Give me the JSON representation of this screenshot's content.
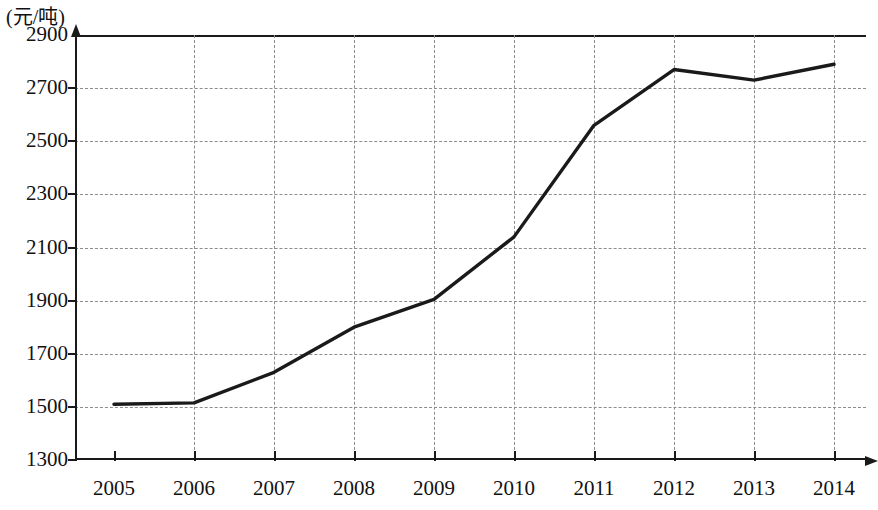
{
  "chart_data": {
    "type": "line",
    "title": "",
    "subtitle": "",
    "ylabel": "(元/吨)",
    "xlabel": "",
    "categories": [
      "2005",
      "2006",
      "2007",
      "2008",
      "2009",
      "2010",
      "2011",
      "2012",
      "2013",
      "2014"
    ],
    "x": [
      2005,
      2006,
      2007,
      2008,
      2009,
      2010,
      2011,
      2012,
      2013,
      2014
    ],
    "series": [
      {
        "name": "价格",
        "values": [
          1510,
          1515,
          1630,
          1800,
          1905,
          2140,
          2560,
          2770,
          2730,
          2790
        ]
      }
    ],
    "ylim": [
      1300,
      2900
    ],
    "yticks": [
      1300,
      1500,
      1700,
      1900,
      2100,
      2300,
      2500,
      2700,
      2900
    ],
    "ytick_labels": [
      "1300",
      "1500",
      "1700",
      "1900",
      "2100",
      "2300",
      "2500",
      "2700",
      "2900"
    ],
    "xtick_labels": [
      "2005",
      "2006",
      "2007",
      "2008",
      "2009",
      "2010",
      "2011",
      "2012",
      "2013",
      "2014"
    ],
    "grid": true,
    "grid_style": "dashed",
    "legend": null,
    "legend_position": "none",
    "line_color": "#1a1a1a",
    "grid_color": "#8c8c8c",
    "background_color": "#ffffff"
  }
}
